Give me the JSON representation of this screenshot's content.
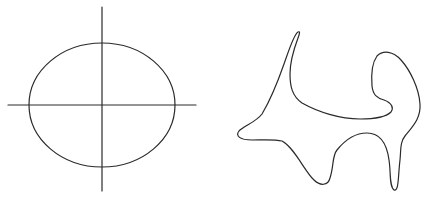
{
  "figure": {
    "background": "#ffffff",
    "stroke_color": "#2a2a2a",
    "stroke_width": 1.2,
    "left_panel": {
      "description": "Ellipse centered on crossing horizontal and vertical axes",
      "axes": {
        "horizontal": {
          "x1": 8,
          "y1": 105,
          "x2": 196,
          "y2": 105
        },
        "vertical": {
          "x1": 102,
          "y1": 7,
          "x2": 102,
          "y2": 191
        }
      },
      "ellipse": {
        "cx": 102,
        "cy": 105,
        "rx": 73,
        "ry": 62
      }
    },
    "right_panel": {
      "description": "Irregular closed curve (blob shape)",
      "path": "M 298 32 C 294 34 289 50 284 64 C 277 84 268 104 262 114 C 256 122 244 126 239 131 C 235 136 240 140 252 140 C 262 140 274 139 282 141 C 294 147 305 172 314 180 C 320 186 328 186 330 178 C 334 166 332 156 337 150 C 345 140 355 133 367 133 C 381 133 387 145 389 160 C 391 172 389 186 394 190 C 399 192 398 176 400 160 C 401 150 400 142 405 136 C 413 126 421 118 420 104 C 419 88 410 70 401 60 C 393 51 383 50 377 56 C 372 63 371 74 372 86 C 373 95 377 98 384 100 C 392 103 394 108 391 112 C 386 117 374 119 360 119 C 340 119 318 112 302 103 C 292 96 290 86 290 74 C 290 60 295 46 298 38 C 300 33 300 31 298 32 Z"
    }
  }
}
